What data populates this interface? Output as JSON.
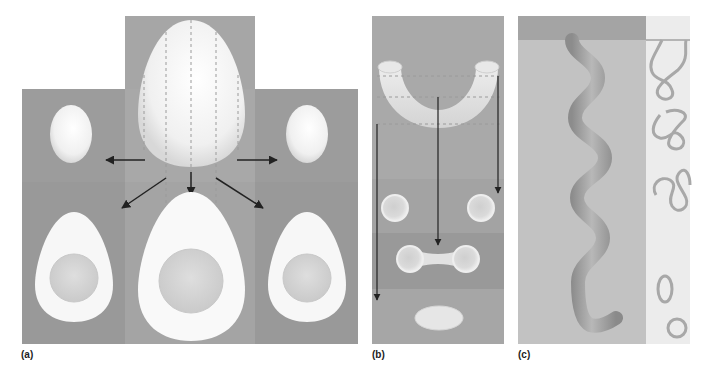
{
  "figure": {
    "panels": [
      {
        "id": "a",
        "label": "(a)",
        "description": "Egg sectioned at different planes: vertical cuts of a large egg produce smaller oval sections; cuts through the center reveal yolk"
      },
      {
        "id": "b",
        "label": "(b)",
        "description": "Curved tube (U-shape) sectioned at three levels: two circles, a dumbbell shape, and an oval"
      },
      {
        "id": "c",
        "label": "(c)",
        "description": "Coiled tube in a block and the resulting thin section showing irregular wavy profiles, an oval, and a circle"
      }
    ]
  },
  "colors": {
    "background": "#ffffff",
    "panel_dark": "#9a9a9a",
    "panel_mid": "#a8a8a8",
    "panel_light": "#b4b4b4",
    "egg_white": "#f6f6f6",
    "yolk": "#d6d6d6",
    "arrow": "#222222",
    "coil_fill": "#a0a0a0",
    "section_bg": "#eaeaea",
    "section_stroke": "#a8a8a8",
    "block_bg": "#c4c4c4",
    "block_top": "#a6a6a6"
  }
}
